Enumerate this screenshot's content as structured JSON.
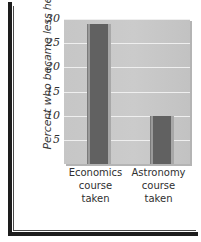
{
  "chart_data": {
    "type": "bar",
    "title": "",
    "subtitle": "",
    "xlabel": "",
    "ylabel": "Percent who became less helpful",
    "categories": [
      "Economics course taken",
      "Astronomy course taken"
    ],
    "category_lines": [
      [
        "Economics",
        "course",
        "taken"
      ],
      [
        "Astronomy",
        "course",
        "taken"
      ]
    ],
    "values": [
      29,
      10
    ],
    "ylim": [
      0,
      30
    ],
    "yticks": [
      5,
      10,
      15,
      20,
      25,
      30
    ],
    "ytick_labels": [
      "5",
      "10",
      "15",
      "20",
      "25",
      "30"
    ],
    "grid": true,
    "legend": "none",
    "colors": {
      "bar": "#616161",
      "plot_background": "#c8c8c8",
      "gridline": "#efefef",
      "frame": "#1d1d1d",
      "text": "#2f2f2f",
      "page_background": "#ffffff"
    }
  }
}
